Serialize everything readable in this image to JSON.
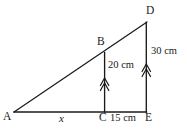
{
  "figure": {
    "type": "geometry-diagram",
    "background_color": "#ffffff",
    "stroke_color": "#1a1a1a",
    "points": {
      "A": {
        "label": "A",
        "x": 14,
        "y": 112
      },
      "B": {
        "label": "B",
        "x": 104,
        "y": 52
      },
      "C": {
        "label": "C",
        "x": 105,
        "y": 112
      },
      "D": {
        "label": "D",
        "x": 147,
        "y": 22
      },
      "E": {
        "label": "E",
        "x": 146,
        "y": 112
      }
    },
    "segments": [
      {
        "name": "base-AE",
        "from": "A",
        "to": "E"
      },
      {
        "name": "hypotenuse-AD",
        "from": "A",
        "to": "D"
      },
      {
        "name": "vertical-BC",
        "from": "B",
        "to": "C"
      },
      {
        "name": "vertical-DE",
        "from": "D",
        "to": "E"
      }
    ],
    "measures": {
      "bc_height": "20 cm",
      "de_height": "30 cm",
      "ce_length": "15 cm",
      "ac_length": "x"
    }
  }
}
